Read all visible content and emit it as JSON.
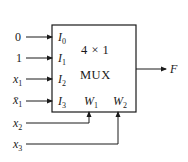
{
  "diagram": {
    "type": "multiplexer block diagram",
    "block": {
      "size_label": "4 × 1",
      "name_label": "MUX"
    },
    "data_inputs": [
      {
        "pin": "I",
        "pin_sub": "0",
        "signal": "0"
      },
      {
        "pin": "I",
        "pin_sub": "1",
        "signal": "1"
      },
      {
        "pin": "I",
        "pin_sub": "2",
        "signal": "x",
        "signal_sub": "1"
      },
      {
        "pin": "I",
        "pin_sub": "3",
        "signal": "x̄",
        "signal_sub": "1"
      }
    ],
    "select_inputs": [
      {
        "pin": "W",
        "pin_sub": "1",
        "signal": "x",
        "signal_sub": "2"
      },
      {
        "pin": "W",
        "pin_sub": "2",
        "signal": "x",
        "signal_sub": "3"
      }
    ],
    "output": {
      "signal": "F"
    }
  }
}
